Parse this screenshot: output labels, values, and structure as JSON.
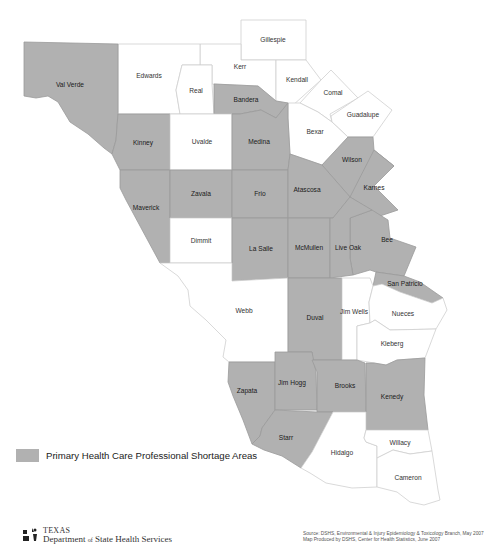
{
  "map": {
    "title": "Primary Health Care Professional Shortage Areas",
    "colors": {
      "shortage_fill": "#b1b1b1",
      "non_shortage_fill": "#ffffff",
      "boundary": "#cfcfcf"
    },
    "counties": [
      {
        "name": "Gillespie",
        "shortage": false
      },
      {
        "name": "Kerr",
        "shortage": false
      },
      {
        "name": "Kendall",
        "shortage": false
      },
      {
        "name": "Comal",
        "shortage": false
      },
      {
        "name": "Guadalupe",
        "shortage": false
      },
      {
        "name": "Edwards",
        "shortage": false
      },
      {
        "name": "Real",
        "shortage": false
      },
      {
        "name": "Val Verde",
        "shortage": true
      },
      {
        "name": "Bandera",
        "shortage": true
      },
      {
        "name": "Bexar",
        "shortage": false
      },
      {
        "name": "Kinney",
        "shortage": true
      },
      {
        "name": "Uvalde",
        "shortage": false
      },
      {
        "name": "Medina",
        "shortage": true
      },
      {
        "name": "Wilson",
        "shortage": true
      },
      {
        "name": "Karnes",
        "shortage": true
      },
      {
        "name": "Maverick",
        "shortage": true
      },
      {
        "name": "Zavala",
        "shortage": true
      },
      {
        "name": "Frio",
        "shortage": true
      },
      {
        "name": "Atascosa",
        "shortage": true
      },
      {
        "name": "Bee",
        "shortage": true
      },
      {
        "name": "Dimmit",
        "shortage": false
      },
      {
        "name": "La Salle",
        "shortage": true
      },
      {
        "name": "McMullen",
        "shortage": true
      },
      {
        "name": "Live Oak",
        "shortage": true
      },
      {
        "name": "San Patricio",
        "shortage": true
      },
      {
        "name": "Webb",
        "shortage": false
      },
      {
        "name": "Duval",
        "shortage": true
      },
      {
        "name": "Jim Wells",
        "shortage": false
      },
      {
        "name": "Nueces",
        "shortage": false
      },
      {
        "name": "Kleberg",
        "shortage": false
      },
      {
        "name": "Zapata",
        "shortage": true
      },
      {
        "name": "Jim Hogg",
        "shortage": true
      },
      {
        "name": "Brooks",
        "shortage": true
      },
      {
        "name": "Kenedy",
        "shortage": true
      },
      {
        "name": "Starr",
        "shortage": true
      },
      {
        "name": "Hidalgo",
        "shortage": false
      },
      {
        "name": "Willacy",
        "shortage": false
      },
      {
        "name": "Cameron",
        "shortage": false
      }
    ]
  },
  "legend": {
    "label": "Primary Health Care Professional Shortage Areas",
    "swatch_color": "#b1b1b1"
  },
  "footer": {
    "logo_line1": "TEXAS",
    "logo_line2_a": "Department ",
    "logo_line2_of": "of",
    "logo_line2_b": " State Health Services",
    "source_line1": "Source: DSHS, Environmental & Injury Epidemiology & Toxicology Branch, May 2007",
    "source_line2": "Map Produced by DSHS, Center for Health Statistics, June 2007"
  }
}
